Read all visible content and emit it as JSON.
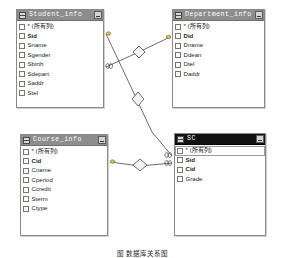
{
  "diagram": {
    "caption": "图 数据库关系图",
    "all_columns_label": "* (所有列)",
    "tables": [
      {
        "id": "student",
        "title": "Student_info",
        "active": false,
        "minimize_label": "",
        "fields": [
          {
            "name": "* (所有列)",
            "pk": false,
            "selected": false
          },
          {
            "name": "Sid",
            "pk": true,
            "selected": false
          },
          {
            "name": "Sname",
            "pk": false,
            "selected": false
          },
          {
            "name": "Sgender",
            "pk": false,
            "selected": false
          },
          {
            "name": "Sbirth",
            "pk": false,
            "selected": false
          },
          {
            "name": "Sdepart",
            "pk": false,
            "selected": false
          },
          {
            "name": "Saddr",
            "pk": false,
            "selected": false
          },
          {
            "name": "Stel",
            "pk": false,
            "selected": false
          }
        ]
      },
      {
        "id": "department",
        "title": "Department_info",
        "active": false,
        "minimize_label": "",
        "fields": [
          {
            "name": "* (所有列)",
            "pk": false,
            "selected": false
          },
          {
            "name": "Did",
            "pk": true,
            "selected": false
          },
          {
            "name": "Dname",
            "pk": false,
            "selected": false
          },
          {
            "name": "Ddean",
            "pk": false,
            "selected": false
          },
          {
            "name": "Dtel",
            "pk": false,
            "selected": false
          },
          {
            "name": "Daddr",
            "pk": false,
            "selected": false
          }
        ]
      },
      {
        "id": "course",
        "title": "Course_info",
        "active": false,
        "minimize_label": "",
        "fields": [
          {
            "name": "* (所有列)",
            "pk": false,
            "selected": false
          },
          {
            "name": "Cid",
            "pk": true,
            "selected": false
          },
          {
            "name": "Cname",
            "pk": false,
            "selected": false
          },
          {
            "name": "Cperiod",
            "pk": false,
            "selected": false
          },
          {
            "name": "Ccredit",
            "pk": false,
            "selected": false
          },
          {
            "name": "Sterm",
            "pk": false,
            "selected": false
          },
          {
            "name": "Ctype",
            "pk": false,
            "selected": false
          }
        ]
      },
      {
        "id": "sc",
        "title": "SC",
        "active": true,
        "minimize_label": "",
        "fields": [
          {
            "name": "* (所有列)",
            "pk": false,
            "selected": true
          },
          {
            "name": "Sid",
            "pk": true,
            "selected": false
          },
          {
            "name": "Cid",
            "pk": true,
            "selected": false
          },
          {
            "name": "Grade",
            "pk": false,
            "selected": false
          }
        ]
      }
    ],
    "relationships": [
      {
        "from": "Student_info.Sdepart",
        "to": "Department_info.Did",
        "from_end": "many",
        "to_end": "key"
      },
      {
        "from": "Student_info.Sid",
        "to": "SC.Sid",
        "from_end": "key",
        "to_end": "many"
      },
      {
        "from": "Course_info.Cid",
        "to": "SC.Cid",
        "from_end": "key",
        "to_end": "many"
      }
    ],
    "colors": {
      "window_border": "#8a8a8a",
      "title_bar": "#8d8d8d",
      "title_bar_active": "#121212",
      "title_text": "#ffffff",
      "field_text": "#1a1a1a",
      "connector": "#5a5a5a",
      "canvas": "#ffffff"
    }
  }
}
